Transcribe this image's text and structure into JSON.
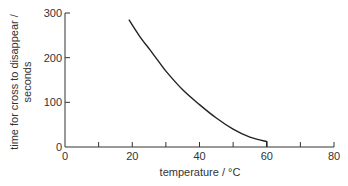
{
  "chart_data": {
    "type": "line",
    "title": "",
    "xlabel": "temperature / °C",
    "ylabel_line1": "time for cross to disappear /",
    "ylabel_line2": "seconds",
    "xlim": [
      0,
      80
    ],
    "ylim": [
      0,
      300
    ],
    "x_ticks": [
      0,
      20,
      40,
      60,
      80
    ],
    "x_minor_ticks": [
      10,
      30,
      50,
      70
    ],
    "y_ticks": [
      0,
      100,
      200,
      300
    ],
    "grid": false,
    "legend": null,
    "series": [
      {
        "name": "reaction time",
        "x": [
          19,
          22,
          25,
          28,
          30,
          35,
          40,
          45,
          50,
          55,
          60
        ],
        "y": [
          285,
          250,
          220,
          190,
          170,
          128,
          95,
          65,
          40,
          22,
          12
        ],
        "end_drop_to_axis": true
      }
    ]
  },
  "labels": {
    "x_axis": "temperature / °C",
    "y_axis_line1": "time for cross to disappear /",
    "y_axis_line2": "seconds"
  }
}
